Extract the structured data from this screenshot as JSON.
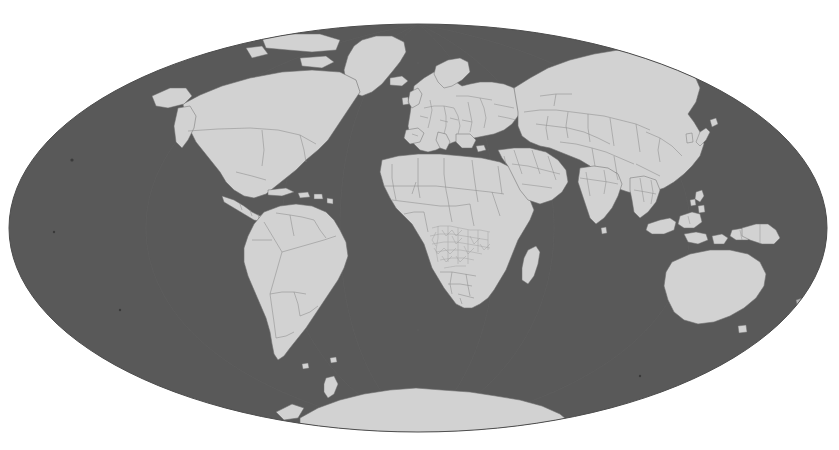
{
  "document": {
    "kind": "world-map-figure",
    "title": "World Map",
    "width": 839,
    "height": 450
  },
  "map": {
    "projection": "Mollweide",
    "projection_label": "Mollweide (equal-area elliptical)",
    "center_longitude": 10,
    "center_latitude": 0,
    "ellipse": {
      "center_x": 418,
      "center_y": 228,
      "radius_x": 409,
      "radius_y": 204
    },
    "background_color": "#ffffff",
    "ocean_color": "#595959",
    "land_color": "#d2d2d2",
    "border_color": "#8d8d8d",
    "coastline_color": "#6f6f6f",
    "graticule_color": "#636363",
    "detail_region_color": "#9c9c9c",
    "has_labels": false,
    "has_legend": false,
    "has_title_text": false,
    "graticule": {
      "visible": true,
      "meridian_step_degrees": 30,
      "parallel_step_degrees": 30,
      "style": "faint"
    },
    "features": [
      {
        "name": "north-america",
        "label": "North America",
        "kind": "continent",
        "has_internal_borders": true
      },
      {
        "name": "greenland",
        "label": "Greenland",
        "kind": "island",
        "has_internal_borders": false
      },
      {
        "name": "iceland",
        "label": "Iceland",
        "kind": "island",
        "has_internal_borders": false
      },
      {
        "name": "central-america",
        "label": "Central America",
        "kind": "region",
        "has_internal_borders": true
      },
      {
        "name": "caribbean",
        "label": "Caribbean Islands",
        "kind": "archipelago",
        "has_internal_borders": false
      },
      {
        "name": "south-america",
        "label": "South America",
        "kind": "continent",
        "has_internal_borders": true
      },
      {
        "name": "europe",
        "label": "Europe",
        "kind": "continent",
        "has_internal_borders": true
      },
      {
        "name": "africa",
        "label": "Africa",
        "kind": "continent",
        "has_internal_borders": true
      },
      {
        "name": "central-africa-detail",
        "label": "Central and Southern Africa subnational detail",
        "kind": "detail-overlay",
        "has_internal_borders": true
      },
      {
        "name": "madagascar",
        "label": "Madagascar",
        "kind": "island",
        "has_internal_borders": false
      },
      {
        "name": "asia",
        "label": "Asia",
        "kind": "continent",
        "has_internal_borders": true
      },
      {
        "name": "middle-east",
        "label": "Middle East",
        "kind": "region",
        "has_internal_borders": true
      },
      {
        "name": "india",
        "label": "India",
        "kind": "country",
        "has_internal_borders": true
      },
      {
        "name": "southeast-asia-islands",
        "label": "Indonesia and Philippines",
        "kind": "archipelago",
        "has_internal_borders": true
      },
      {
        "name": "japan",
        "label": "Japan",
        "kind": "island",
        "has_internal_borders": false
      },
      {
        "name": "australia",
        "label": "Australia",
        "kind": "continent",
        "has_internal_borders": false
      },
      {
        "name": "new-guinea",
        "label": "New Guinea",
        "kind": "island",
        "has_internal_borders": true
      },
      {
        "name": "new-zealand",
        "label": "New Zealand",
        "kind": "island",
        "has_internal_borders": false
      },
      {
        "name": "antarctica",
        "label": "Antarctica",
        "kind": "continent",
        "has_internal_borders": false
      }
    ]
  }
}
